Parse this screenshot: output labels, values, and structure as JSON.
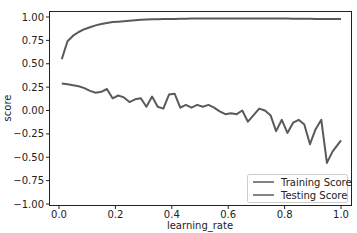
{
  "chart_data": {
    "type": "line",
    "title": "",
    "xlabel": "learning_rate",
    "ylabel": "score",
    "xlim": [
      -0.03,
      1.04
    ],
    "ylim": [
      -1.0,
      1.06
    ],
    "xticks": [
      0.0,
      0.2,
      0.4,
      0.6,
      0.8,
      1.0
    ],
    "xtick_labels": [
      "0.0",
      "0.2",
      "0.4",
      "0.6",
      "0.8",
      "1.0"
    ],
    "yticks": [
      1.0,
      0.75,
      0.5,
      0.25,
      0.0,
      -0.25,
      -0.5,
      -0.75,
      -1.0
    ],
    "ytick_labels": [
      "1.00",
      "0.75",
      "0.50",
      "0.25",
      "0.00",
      "−0.25",
      "−0.50",
      "−0.75",
      "−1.00"
    ],
    "grid": false,
    "legend_position": "lower right",
    "line_color": "#5a5a5a",
    "x": [
      0.01,
      0.03,
      0.05,
      0.07,
      0.09,
      0.11,
      0.13,
      0.15,
      0.17,
      0.19,
      0.21,
      0.23,
      0.25,
      0.27,
      0.29,
      0.31,
      0.33,
      0.35,
      0.37,
      0.39,
      0.41,
      0.43,
      0.45,
      0.47,
      0.49,
      0.51,
      0.53,
      0.55,
      0.57,
      0.59,
      0.61,
      0.63,
      0.65,
      0.67,
      0.69,
      0.71,
      0.73,
      0.75,
      0.77,
      0.79,
      0.81,
      0.83,
      0.85,
      0.87,
      0.89,
      0.91,
      0.93,
      0.95,
      0.97,
      1.0
    ],
    "series": [
      {
        "name": "Training Score",
        "values": [
          0.55,
          0.74,
          0.8,
          0.84,
          0.87,
          0.89,
          0.91,
          0.925,
          0.935,
          0.945,
          0.95,
          0.955,
          0.96,
          0.965,
          0.97,
          0.972,
          0.975,
          0.977,
          0.978,
          0.979,
          0.98,
          0.981,
          0.982,
          0.983,
          0.983,
          0.984,
          0.984,
          0.984,
          0.985,
          0.985,
          0.985,
          0.985,
          0.985,
          0.985,
          0.985,
          0.984,
          0.984,
          0.984,
          0.983,
          0.983,
          0.983,
          0.982,
          0.982,
          0.981,
          0.981,
          0.98,
          0.98,
          0.979,
          0.978,
          0.978
        ]
      },
      {
        "name": "Testing Score",
        "values": [
          0.29,
          0.28,
          0.27,
          0.26,
          0.24,
          0.21,
          0.19,
          0.2,
          0.23,
          0.13,
          0.16,
          0.14,
          0.09,
          0.12,
          0.13,
          0.04,
          0.15,
          0.04,
          0.02,
          0.17,
          0.18,
          0.03,
          0.06,
          0.03,
          0.06,
          0.04,
          0.06,
          0.03,
          -0.01,
          -0.04,
          -0.03,
          -0.04,
          0.0,
          -0.12,
          -0.05,
          0.02,
          0.0,
          -0.05,
          -0.22,
          -0.1,
          -0.24,
          -0.13,
          -0.1,
          -0.15,
          -0.36,
          -0.2,
          -0.1,
          -0.56,
          -0.44,
          -0.32
        ]
      }
    ]
  }
}
